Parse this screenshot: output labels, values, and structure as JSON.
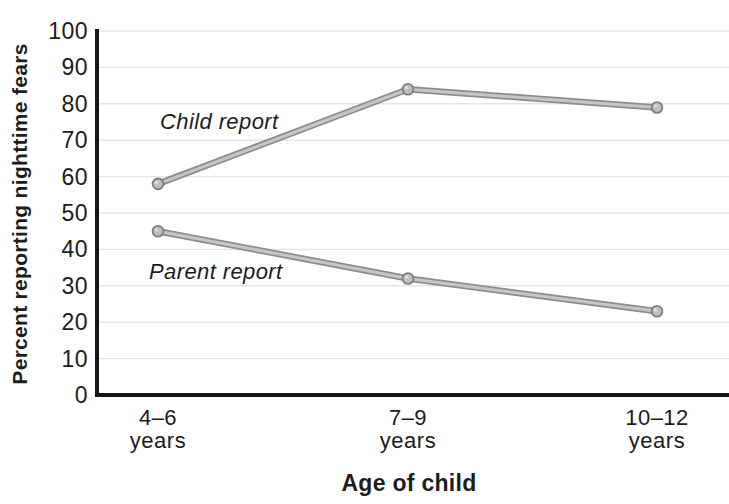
{
  "figure": {
    "background": "#ffffff",
    "text_color": "#1c1c1c"
  },
  "chart_data": {
    "type": "line",
    "title": "",
    "xlabel": "Age of child",
    "ylabel": "Percent reporting nighttime fears",
    "categories": [
      "4–6",
      "7–9",
      "10–12"
    ],
    "category_suffix": "years",
    "series": [
      {
        "name": "Child report",
        "values": [
          58,
          84,
          79
        ]
      },
      {
        "name": "Parent report",
        "values": [
          45,
          32,
          23
        ]
      }
    ],
    "ylim": [
      0,
      100
    ],
    "ytick_step": 10,
    "grid": "horizontal",
    "legend": "inline-labels",
    "colors": {
      "axis": "#161616",
      "grid": "#e7e3e3",
      "line_outer": "#8d8d8d",
      "line_inner": "#c6c6c6",
      "marker_fill": "#bfbfbf",
      "marker_stroke": "#7e7e7e",
      "marker_highlight": "#dedede"
    }
  }
}
